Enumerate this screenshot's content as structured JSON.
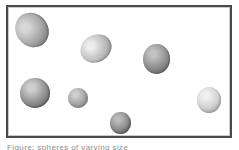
{
  "figure": {
    "background_color": "#ffffff",
    "panel": {
      "border_color": "#4a4a4a",
      "inner_edge_color": "#c9c9c9",
      "fill_color": "#ffffff",
      "x": 6,
      "y": 5,
      "width": 226,
      "height": 133
    },
    "caption": {
      "text": "Figure: spheres of varying size",
      "clipped": true,
      "color": "#8e8e8e"
    },
    "particle_count": 7,
    "particles": [
      {
        "id": "particle-1",
        "label": "top-left ellipsoid",
        "x": 16,
        "y": 12,
        "width": 32,
        "height": 36,
        "rotation_deg": -38,
        "highlight_color": "#d8d8d8",
        "mid_color": "#a8a8a8",
        "edge_color": "#6e6e6e",
        "tone": "medium"
      },
      {
        "id": "particle-2",
        "label": "upper-middle ellipsoid",
        "x": 80,
        "y": 35,
        "width": 32,
        "height": 27,
        "rotation_deg": -28,
        "highlight_color": "#ededed",
        "mid_color": "#c0c0c0",
        "edge_color": "#8a8a8a",
        "tone": "light"
      },
      {
        "id": "particle-3",
        "label": "right-upper sphere",
        "x": 143,
        "y": 44,
        "width": 27,
        "height": 30,
        "rotation_deg": 0,
        "highlight_color": "#c2c2c2",
        "mid_color": "#909090",
        "edge_color": "#5e5e5e",
        "tone": "dark"
      },
      {
        "id": "particle-4",
        "label": "left-lower large sphere",
        "x": 20,
        "y": 78,
        "width": 30,
        "height": 30,
        "rotation_deg": 0,
        "highlight_color": "#d0d0d0",
        "mid_color": "#939393",
        "edge_color": "#5a5a5a",
        "tone": "dark"
      },
      {
        "id": "particle-5",
        "label": "center small sphere",
        "x": 68,
        "y": 88,
        "width": 20,
        "height": 20,
        "rotation_deg": 0,
        "highlight_color": "#cfcfcf",
        "mid_color": "#a5a5a5",
        "edge_color": "#7b7b7b",
        "tone": "medium"
      },
      {
        "id": "particle-6",
        "label": "bottom-center sphere",
        "x": 110,
        "y": 112,
        "width": 21,
        "height": 22,
        "rotation_deg": 0,
        "highlight_color": "#bcbcbc",
        "mid_color": "#8c8c8c",
        "edge_color": "#555555",
        "tone": "dark"
      },
      {
        "id": "particle-7",
        "label": "right-lower pale sphere",
        "x": 197,
        "y": 87,
        "width": 24,
        "height": 26,
        "rotation_deg": 0,
        "highlight_color": "#f0f0f0",
        "mid_color": "#d4d4d4",
        "edge_color": "#9a9a9a",
        "tone": "light"
      }
    ]
  }
}
